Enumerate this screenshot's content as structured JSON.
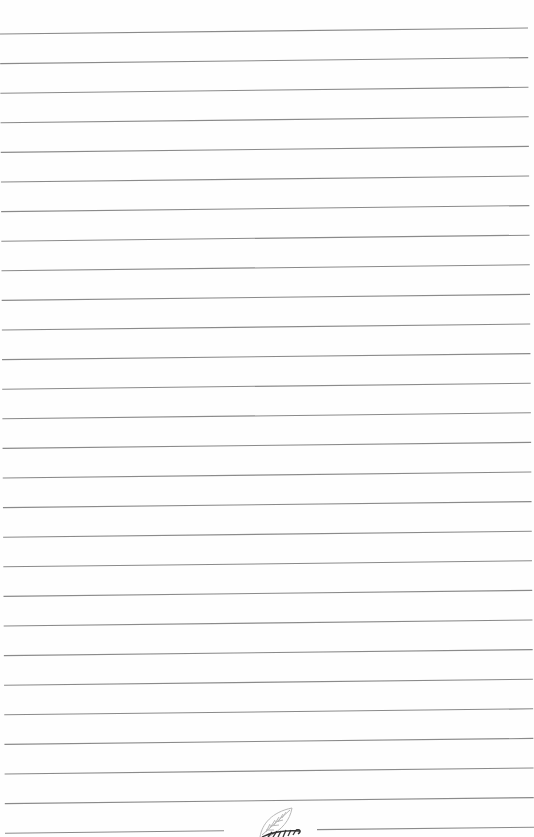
{
  "page": {
    "type": "ruled-notebook-page",
    "background": "#fefefe",
    "line_color": "#8a8a8a",
    "line_count": 28,
    "line_spacing_px": 29.6,
    "first_line_left_y": 34,
    "first_line_right_y": 28,
    "line_left_x_top": 0,
    "line_left_x_bottom": 5,
    "line_right_x_top": 528,
    "line_right_x_bottom": 534,
    "last_line_gap": {
      "from_x": 224,
      "to_x": 317
    }
  },
  "footer": {
    "logo_icon": "leaf-logo-icon"
  }
}
